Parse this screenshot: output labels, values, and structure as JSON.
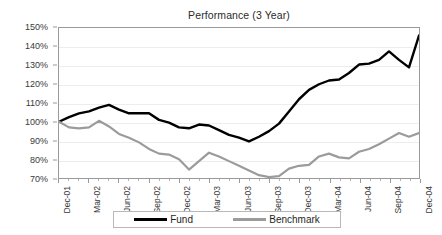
{
  "chart_data": {
    "type": "line",
    "title": "Performance (3 Year)",
    "xlabel": "",
    "ylabel": "",
    "ylim": [
      70,
      150
    ],
    "ytick_labels": [
      "150%",
      "140%",
      "130%",
      "120%",
      "110%",
      "100%",
      "90%",
      "80%",
      "70%"
    ],
    "ytick_values": [
      150,
      140,
      130,
      120,
      110,
      100,
      90,
      80,
      70
    ],
    "grid": true,
    "legend_position": "bottom",
    "x": [
      "Dec-01",
      "Jan-02",
      "Feb-02",
      "Mar-02",
      "Apr-02",
      "May-02",
      "Jun-02",
      "Jul-02",
      "Aug-02",
      "Sep-02",
      "Oct-02",
      "Nov-02",
      "Dec-02",
      "Jan-03",
      "Feb-03",
      "Mar-03",
      "Apr-03",
      "May-03",
      "Jun-03",
      "Jul-03",
      "Aug-03",
      "Sep-03",
      "Oct-03",
      "Nov-03",
      "Dec-03",
      "Jan-04",
      "Feb-04",
      "Mar-04",
      "Apr-04",
      "May-04",
      "Jun-04",
      "Jul-04",
      "Aug-04",
      "Sep-04",
      "Oct-04",
      "Nov-04",
      "Dec-04"
    ],
    "xtick_labels": [
      "Dec-01",
      "Mar-02",
      "Jun-02",
      "Sep-02",
      "Dec-02",
      "Mar-03",
      "Jun-03",
      "Sep-03",
      "Dec-03",
      "Mar-04",
      "Jun-04",
      "Sep-04",
      "Dec-04"
    ],
    "series": [
      {
        "name": "Fund",
        "color": "#000000",
        "values": [
          100.0,
          102.5,
          104.5,
          105.5,
          107.5,
          109.0,
          106.5,
          104.5,
          104.5,
          104.5,
          101.0,
          99.5,
          97.0,
          96.5,
          98.5,
          98.0,
          95.5,
          93.0,
          91.5,
          89.5,
          92.0,
          95.0,
          99.0,
          105.5,
          112.0,
          117.0,
          120.0,
          122.0,
          122.5,
          126.0,
          130.5,
          131.0,
          133.0,
          137.5,
          133.0,
          129.0,
          146.0
        ]
      },
      {
        "name": "Benchmark",
        "color": "#9b9b9b",
        "values": [
          100.0,
          97.0,
          96.5,
          97.0,
          100.5,
          97.5,
          93.5,
          91.5,
          89.0,
          85.5,
          83.0,
          82.5,
          80.0,
          74.5,
          79.0,
          83.5,
          81.5,
          79.0,
          76.5,
          74.0,
          71.5,
          70.5,
          71.0,
          75.0,
          76.5,
          77.0,
          81.5,
          83.0,
          81.0,
          80.5,
          84.0,
          85.5,
          88.0,
          91.0,
          94.0,
          92.0,
          94.0
        ]
      }
    ]
  },
  "legend": {
    "items": [
      {
        "label": "Fund",
        "swatch": "fund"
      },
      {
        "label": "Benchmark",
        "swatch": "benchmark"
      }
    ]
  }
}
